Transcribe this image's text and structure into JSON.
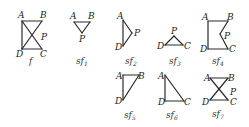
{
  "figures": [
    {
      "id": "f",
      "label": "f",
      "subscript": "",
      "vertices": {
        "A": [
          22,
          21
        ],
        "B": [
          42,
          21
        ],
        "C": [
          42,
          49
        ],
        "D": [
          22,
          49
        ],
        "P": [
          32,
          35
        ]
      },
      "edges": [
        [
          "A",
          "B"
        ],
        [
          "A",
          "D"
        ],
        [
          "D",
          "C"
        ],
        [
          "A",
          "C"
        ],
        [
          "B",
          "D"
        ]
      ],
      "label_positions": {
        "A": [
          18,
          18
        ],
        "B": [
          40,
          18
        ],
        "P": [
          41,
          40
        ],
        "D": [
          16,
          57
        ],
        "C": [
          40,
          57
        ]
      },
      "caption_pos": [
        29,
        64
      ]
    },
    {
      "id": "sf1",
      "label": "sf",
      "subscript": "1",
      "vertices": {
        "A": [
          74,
          22
        ],
        "B": [
          90,
          22
        ],
        "P": [
          82,
          33
        ]
      },
      "edges": [
        [
          "A",
          "B"
        ],
        [
          "A",
          "P"
        ],
        [
          "B",
          "P"
        ]
      ],
      "label_positions": {
        "A": [
          70,
          19
        ],
        "B": [
          88,
          19
        ],
        "P": [
          79,
          42
        ]
      },
      "caption_pos": [
        76,
        64
      ]
    },
    {
      "id": "sf2",
      "label": "sf",
      "subscript": "2",
      "vertices": {
        "A": [
          123,
          20
        ],
        "D": [
          123,
          46
        ],
        "P": [
          132,
          33
        ]
      },
      "edges": [
        [
          "A",
          "D"
        ],
        [
          "A",
          "P"
        ],
        [
          "D",
          "P"
        ]
      ],
      "label_positions": {
        "A": [
          117,
          19
        ],
        "D": [
          115,
          50
        ],
        "P": [
          134,
          36
        ]
      },
      "caption_pos": [
        125,
        64
      ]
    },
    {
      "id": "sf3",
      "label": "sf",
      "subscript": "3",
      "vertices": {
        "P": [
          174,
          36
        ],
        "D": [
          165,
          45
        ],
        "C": [
          183,
          45
        ]
      },
      "edges": [
        [
          "P",
          "D"
        ],
        [
          "P",
          "C"
        ],
        [
          "D",
          "C"
        ]
      ],
      "label_positions": {
        "P": [
          171,
          34
        ],
        "D": [
          157,
          49
        ],
        "C": [
          184,
          49
        ]
      },
      "caption_pos": [
        169,
        64
      ]
    },
    {
      "id": "sf4",
      "label": "sf",
      "subscript": "4",
      "vertices": {
        "A": [
          208,
          21
        ],
        "B": [
          228,
          21
        ],
        "P": [
          220,
          34
        ],
        "C": [
          228,
          49
        ],
        "D": [
          208,
          49
        ]
      },
      "edges": [
        [
          "A",
          "B"
        ],
        [
          "B",
          "P"
        ],
        [
          "P",
          "C"
        ],
        [
          "C",
          "D"
        ],
        [
          "D",
          "A"
        ]
      ],
      "label_positions": {
        "A": [
          202,
          20
        ],
        "B": [
          227,
          20
        ],
        "P": [
          224,
          39
        ],
        "D": [
          200,
          52
        ],
        "C": [
          229,
          52
        ]
      },
      "caption_pos": [
        212,
        64
      ]
    },
    {
      "id": "sf5",
      "label": "sf",
      "subscript": "5",
      "vertices": {
        "A": [
          123,
          75
        ],
        "B": [
          139,
          75
        ],
        "D": [
          123,
          100
        ]
      },
      "edges": [
        [
          "A",
          "B"
        ],
        [
          "A",
          "D"
        ],
        [
          "B",
          "D"
        ]
      ],
      "label_positions": {
        "A": [
          116,
          79
        ],
        "B": [
          138,
          79
        ],
        "D": [
          115,
          104
        ]
      },
      "caption_pos": [
        124,
        118
      ]
    },
    {
      "id": "sf6",
      "label": "sf",
      "subscript": "6",
      "vertices": {
        "A": [
          165,
          75
        ],
        "D": [
          165,
          101
        ],
        "C": [
          184,
          101
        ]
      },
      "edges": [
        [
          "A",
          "D"
        ],
        [
          "D",
          "C"
        ],
        [
          "A",
          "C"
        ]
      ],
      "label_positions": {
        "A": [
          158,
          79
        ],
        "D": [
          158,
          105
        ],
        "C": [
          184,
          105
        ]
      },
      "caption_pos": [
        166,
        118
      ]
    },
    {
      "id": "sf7",
      "label": "sf",
      "subscript": "7",
      "vertices": {
        "A": [
          210,
          78
        ],
        "B": [
          228,
          78
        ],
        "C": [
          228,
          100
        ],
        "D": [
          210,
          100
        ],
        "P": [
          219,
          89
        ]
      },
      "edges": [
        [
          "A",
          "B"
        ],
        [
          "D",
          "C"
        ],
        [
          "A",
          "C"
        ],
        [
          "B",
          "D"
        ]
      ],
      "label_positions": {
        "A": [
          204,
          81
        ],
        "B": [
          228,
          81
        ],
        "P": [
          230,
          95
        ],
        "D": [
          202,
          105
        ],
        "C": [
          230,
          105
        ]
      },
      "caption_pos": [
        212,
        117
      ]
    }
  ]
}
